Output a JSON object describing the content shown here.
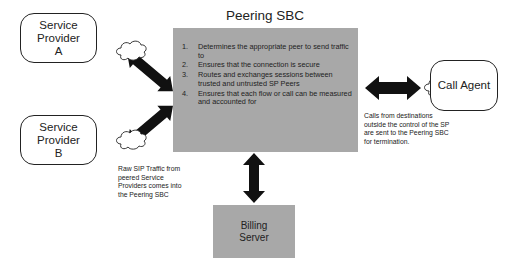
{
  "title": "Peering SBC",
  "sbc": {
    "title": "Peering SBC",
    "functions": [
      {
        "num": "1.",
        "text": "Determines the appropriate peer to send traffic to"
      },
      {
        "num": "2.",
        "text": "Ensures that the connection is secure"
      },
      {
        "num": "3.",
        "text": "Routes and exchanges sessions between trusted and untrusted SP Peers"
      },
      {
        "num": "4.",
        "text": "Ensures that each flow or call can be measured and accounted for"
      }
    ],
    "fill_color": "#a8a8a8"
  },
  "nodes": {
    "service_provider_a": {
      "line1": "Service Provider",
      "line2": "A"
    },
    "service_provider_b": {
      "line1": "Service Provider",
      "line2": "B"
    },
    "call_agent": {
      "label": "Call Agent"
    },
    "billing_server": {
      "line1": "Billing",
      "line2": "Server"
    }
  },
  "notes": {
    "raw_sip": "Raw SIP Traffic from peered Service Providers comes into the Peering SBC",
    "calls_from_destinations": "Calls from destinations outside the control of the SP are sent to the Peering SBC for termination."
  },
  "icons": {
    "cloud": "cloud-icon",
    "arrow": "double-headed-arrow"
  }
}
